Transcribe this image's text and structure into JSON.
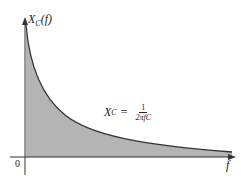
{
  "diagram": {
    "y_axis_label": {
      "symbol": "X",
      "subscript": "C",
      "arg": "(f)"
    },
    "x_axis_label": "f",
    "origin_label": "0",
    "formula": {
      "lhs_symbol": "X",
      "lhs_subscript": "C",
      "equals": "=",
      "numerator": "1",
      "denominator": "2πfC"
    },
    "colors": {
      "fill": "#b4b4b4",
      "curve": "#333333",
      "axis": "#333333",
      "background": "#ffffff"
    }
  }
}
